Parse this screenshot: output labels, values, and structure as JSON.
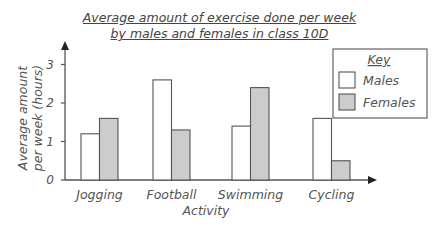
{
  "chart_data": {
    "type": "bar",
    "title": "Average amount of exercise done per week by males and females in class 10D",
    "title_lines": [
      "Average amount of exercise done per week",
      "by males and females in class 10D"
    ],
    "xlabel": "Activity",
    "ylabel": "Average amount per week (hours)",
    "ylabel_lines": [
      "Average amount",
      "per week (hours)"
    ],
    "categories": [
      "Jogging",
      "Football",
      "Swimming",
      "Cycling"
    ],
    "series": [
      {
        "name": "Males",
        "values": [
          1.2,
          2.6,
          1.4,
          1.6
        ],
        "color": "#ffffff"
      },
      {
        "name": "Females",
        "values": [
          1.6,
          1.3,
          2.4,
          0.5
        ],
        "color": "#cccccc"
      }
    ],
    "yticks": [
      0,
      1,
      2,
      3
    ],
    "ylim": [
      0,
      3.4
    ],
    "grid": false,
    "legend": {
      "title": "Key",
      "position": "top-right",
      "entries": [
        "Males",
        "Females"
      ]
    }
  }
}
